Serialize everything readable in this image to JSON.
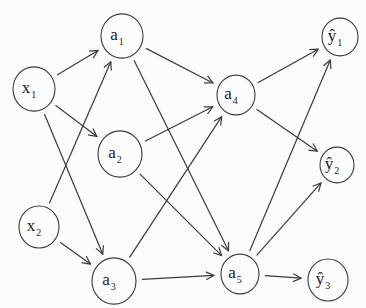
{
  "diagram": {
    "type": "neural-network",
    "layers": [
      {
        "name": "input",
        "nodes": [
          "x1",
          "x2"
        ]
      },
      {
        "name": "hidden-1",
        "nodes": [
          "a1",
          "a2",
          "a3"
        ]
      },
      {
        "name": "hidden-2",
        "nodes": [
          "a4",
          "a5"
        ]
      },
      {
        "name": "output",
        "nodes": [
          "y1",
          "y2",
          "y3"
        ]
      }
    ],
    "nodes": [
      {
        "id": "x1",
        "base": "x",
        "hat": false,
        "sub": "1",
        "cx": 34,
        "cy": 89,
        "r": 21
      },
      {
        "id": "x2",
        "base": "x",
        "hat": false,
        "sub": "2",
        "cx": 39,
        "cy": 227,
        "r": 20
      },
      {
        "id": "a1",
        "base": "a",
        "hat": false,
        "sub": "1",
        "cx": 122,
        "cy": 36,
        "r": 21
      },
      {
        "id": "a2",
        "base": "a",
        "hat": false,
        "sub": "2",
        "cx": 120,
        "cy": 154,
        "r": 22
      },
      {
        "id": "a3",
        "base": "a",
        "hat": false,
        "sub": "3",
        "cx": 114,
        "cy": 281,
        "r": 22
      },
      {
        "id": "a4",
        "base": "a",
        "hat": false,
        "sub": "4",
        "cx": 236,
        "cy": 95,
        "r": 19
      },
      {
        "id": "a5",
        "base": "a",
        "hat": false,
        "sub": "5",
        "cx": 240,
        "cy": 274,
        "r": 19
      },
      {
        "id": "y1",
        "base": "ŷ",
        "hat": true,
        "sub": "1",
        "cx": 340,
        "cy": 37,
        "r": 18
      },
      {
        "id": "y2",
        "base": "ŷ",
        "hat": true,
        "sub": "2",
        "cx": 337,
        "cy": 165,
        "r": 17
      },
      {
        "id": "y3",
        "base": "ŷ",
        "hat": true,
        "sub": "3",
        "cx": 328,
        "cy": 280,
        "r": 20
      }
    ],
    "edges": [
      {
        "from": "x1",
        "to": "a1"
      },
      {
        "from": "x1",
        "to": "a2"
      },
      {
        "from": "x1",
        "to": "a3"
      },
      {
        "from": "x2",
        "to": "a1"
      },
      {
        "from": "x2",
        "to": "a3"
      },
      {
        "from": "a1",
        "to": "a4"
      },
      {
        "from": "a1",
        "to": "a5"
      },
      {
        "from": "a2",
        "to": "a4"
      },
      {
        "from": "a2",
        "to": "a5"
      },
      {
        "from": "a3",
        "to": "a4"
      },
      {
        "from": "a3",
        "to": "a5"
      },
      {
        "from": "a4",
        "to": "y1"
      },
      {
        "from": "a4",
        "to": "y2"
      },
      {
        "from": "a5",
        "to": "y1"
      },
      {
        "from": "a5",
        "to": "y2"
      },
      {
        "from": "a5",
        "to": "y3"
      }
    ],
    "colors": {
      "stroke": "#3a3a3a",
      "text": "#222222",
      "background": "#fcfcfc"
    }
  }
}
